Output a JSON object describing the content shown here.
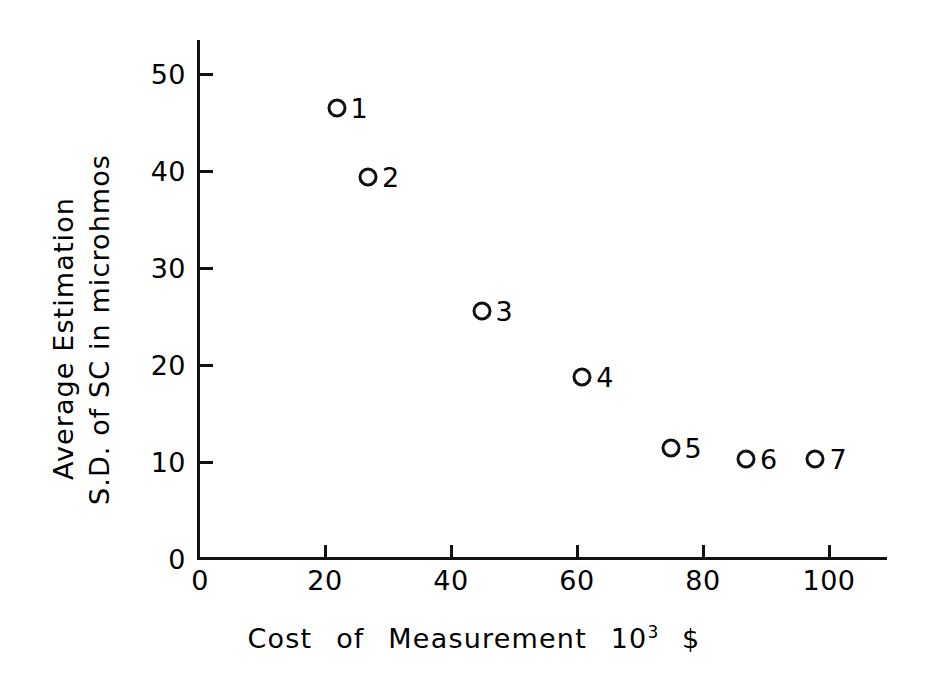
{
  "chart_data": {
    "type": "scatter",
    "title": "",
    "xlabel": "Cost of Measurement 10^3 $",
    "ylabel": "Average Estimation S.D. of SC in microhmos",
    "xlim": [
      0,
      109
    ],
    "ylim": [
      0,
      54
    ],
    "grid": false,
    "legend": "none",
    "marker": "open-circle",
    "xticks": [
      "0",
      "20",
      "40",
      "60",
      "80",
      "100"
    ],
    "xtick_values": [
      0,
      20,
      40,
      60,
      80,
      100
    ],
    "yticks": [
      "0",
      "10",
      "20",
      "30",
      "40",
      "50"
    ],
    "ytick_values": [
      0,
      10,
      20,
      30,
      40,
      50
    ],
    "points": [
      {
        "label": "1",
        "x": 22,
        "y": 46.4
      },
      {
        "label": "2",
        "x": 27,
        "y": 39.3
      },
      {
        "label": "3",
        "x": 45,
        "y": 25.5
      },
      {
        "label": "4",
        "x": 61,
        "y": 18.7
      },
      {
        "label": "5",
        "x": 75,
        "y": 11.3
      },
      {
        "label": "6",
        "x": 87,
        "y": 10.2
      },
      {
        "label": "7",
        "x": 98,
        "y": 10.2
      }
    ]
  },
  "axes": {
    "x_title_words": [
      "Cost",
      "of",
      "Measurement"
    ],
    "x_title_unit_base": "10",
    "x_title_unit_exp": "3",
    "x_title_currency": "$",
    "y_title_line_1": "Average  Estimation",
    "y_title_line_2": "S.D. of SC  in  microhmos"
  },
  "colors": {
    "ink": "#111111",
    "background": "#ffffff"
  }
}
